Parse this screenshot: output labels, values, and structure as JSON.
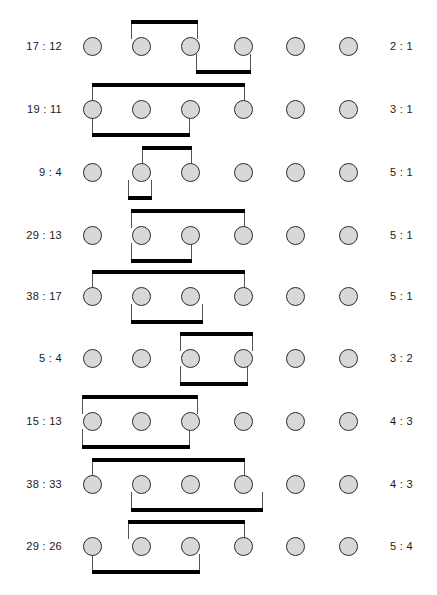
{
  "figure": {
    "type": "bracket-diagram",
    "columns": 6,
    "column_x": [
      92,
      141,
      190,
      243,
      295,
      348
    ],
    "node_diameter": 19,
    "colors": {
      "node_fill": "#d8d8d8",
      "node_stroke": "#2b2b2b",
      "bar": "#000000",
      "stem": "#555555",
      "text": "#1a1a1a",
      "background": "#ffffff"
    },
    "left_label_x": 62,
    "right_label_x": 390
  },
  "rows": [
    {
      "id": "row-1",
      "y": 46,
      "left_label": "17 : 12",
      "right_label": "2 : 1",
      "top_bracket": {
        "x1": 131,
        "x2": 198
      },
      "bottom_bracket": {
        "x1": 196,
        "x2": 251
      }
    },
    {
      "id": "row-2",
      "y": 109,
      "left_label": "19 : 11",
      "right_label": "3 : 1",
      "top_bracket": {
        "x1": 92,
        "x2": 245
      },
      "bottom_bracket": {
        "x1": 92,
        "x2": 190
      }
    },
    {
      "id": "row-3",
      "y": 172,
      "left_label": "9 : 4",
      "right_label": "5 : 1",
      "top_bracket": {
        "x1": 142,
        "x2": 192
      },
      "bottom_bracket": {
        "x1": 128,
        "x2": 152
      }
    },
    {
      "id": "row-4",
      "y": 235,
      "left_label": "29 : 13",
      "right_label": "5 : 1",
      "top_bracket": {
        "x1": 131,
        "x2": 245
      },
      "bottom_bracket": {
        "x1": 131,
        "x2": 192
      }
    },
    {
      "id": "row-5",
      "y": 296,
      "left_label": "38 : 17",
      "right_label": "5 : 1",
      "top_bracket": {
        "x1": 92,
        "x2": 245
      },
      "bottom_bracket": {
        "x1": 131,
        "x2": 203
      }
    },
    {
      "id": "row-6",
      "y": 358,
      "left_label": "5 : 4",
      "right_label": "3 :  2",
      "top_bracket": {
        "x1": 180,
        "x2": 253
      },
      "bottom_bracket": {
        "x1": 180,
        "x2": 248
      }
    },
    {
      "id": "row-7",
      "y": 421,
      "left_label": "15 : 13",
      "right_label": "4 :  3",
      "top_bracket": {
        "x1": 82,
        "x2": 198
      },
      "bottom_bracket": {
        "x1": 82,
        "x2": 190
      }
    },
    {
      "id": "row-8",
      "y": 484,
      "left_label": "38 : 33",
      "right_label": "4 :  3",
      "top_bracket": {
        "x1": 92,
        "x2": 245
      },
      "bottom_bracket": {
        "x1": 131,
        "x2": 263
      }
    },
    {
      "id": "row-9",
      "y": 546,
      "left_label": "29 : 26",
      "right_label": "5 :  4",
      "top_bracket": {
        "x1": 128,
        "x2": 245
      },
      "bottom_bracket": {
        "x1": 92,
        "x2": 200
      }
    }
  ]
}
